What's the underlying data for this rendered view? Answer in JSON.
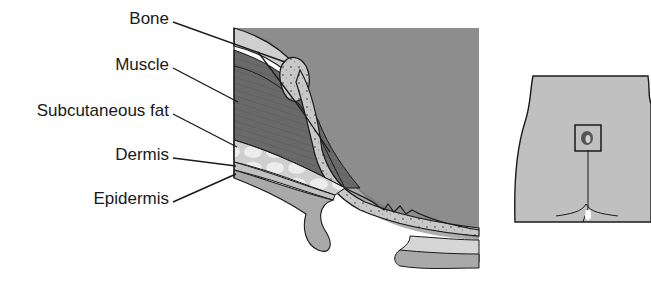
{
  "diagram": {
    "type": "anatomical cross-section",
    "labels": [
      {
        "id": "bone",
        "text": "Bone"
      },
      {
        "id": "muscle",
        "text": "Muscle"
      },
      {
        "id": "subcutaneous_fat",
        "text": "Subcutaneous fat"
      },
      {
        "id": "dermis",
        "text": "Dermis"
      },
      {
        "id": "epidermis",
        "text": "Epidermis"
      }
    ],
    "colors": {
      "bone": "#c9c9c9",
      "muscle": "#6e6e6e",
      "cavity": "#8a8a8a",
      "fat": "#dcdcdc",
      "dermis": "#bdbdbd",
      "epidermis": "#a8a8a8",
      "outline": "#1a1a1a",
      "body_silhouette": "#bfbfbf"
    },
    "inset": {
      "description": "Posterior body view with highlighted sacral region",
      "highlight_box": true
    }
  }
}
